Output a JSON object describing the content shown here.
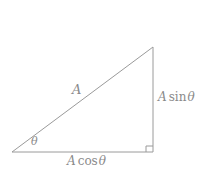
{
  "figure": {
    "type": "right-triangle-trigonometry-diagram",
    "background_color": "#ffffff",
    "stroke_color": "#9a9a9a",
    "text_color": "#8a8a8a"
  },
  "labels": {
    "hypotenuse": "A",
    "angle": "θ",
    "opposite_side_prefix": "A",
    "opposite_side_function": "sin",
    "opposite_side_variable": "θ",
    "adjacent_side_prefix": "A",
    "adjacent_side_function": "cos",
    "adjacent_side_variable": "θ"
  },
  "geometry": {
    "left_vertex": {
      "x": 12,
      "y": 152
    },
    "right_vertex": {
      "x": 153,
      "y": 152
    },
    "apex_vertex": {
      "x": 153,
      "y": 47
    },
    "right_angle_marker": {
      "x": 146,
      "y": 145,
      "size": 6
    }
  }
}
